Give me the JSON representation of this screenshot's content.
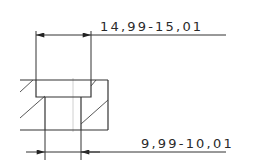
{
  "drawing": {
    "type": "technical-section-view",
    "feature": "counterbored-hole",
    "colors": {
      "line": "#333333",
      "centerline": "#d0d0d0",
      "background": "#ffffff"
    },
    "dimensions": [
      {
        "id": "counterbore-diameter",
        "text": "14,99-15,01"
      },
      {
        "id": "hole-diameter",
        "text": "9,99-10,01"
      }
    ]
  }
}
